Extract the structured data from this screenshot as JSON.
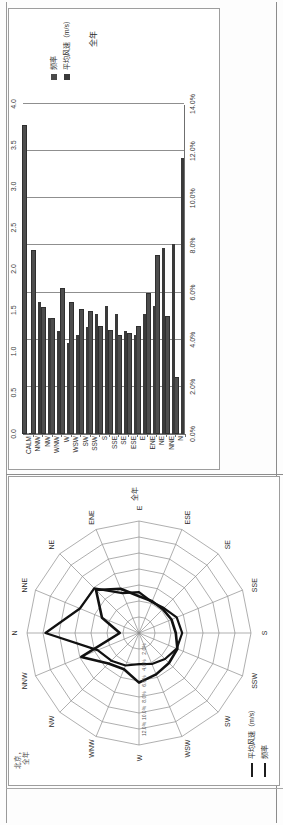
{
  "document": {
    "caption": "图 2-3-1  北京全年风玫瑰图",
    "bottom_caption_line1": "北京，",
    "bottom_caption_line2": "全年"
  },
  "bar_chart_panel": {
    "legend": [
      {
        "label": "频率",
        "color": "#4a4a4a"
      },
      {
        "label": "平均风速（m/s）",
        "color": "#3a3a3a"
      }
    ],
    "subtitle": "全年"
  },
  "rose_panel": {
    "title": "全年",
    "legend": [
      {
        "label": "平均风速（m/s）",
        "style": "thick-line"
      },
      {
        "label": "频率",
        "style": "thick-line"
      }
    ],
    "radial_ticks": [
      "2.0%",
      "4.0%",
      "6.0%",
      "8.0%",
      "10.0%",
      "12.0%"
    ],
    "directions": [
      "N",
      "NNE",
      "NE",
      "ENE",
      "E",
      "ESE",
      "SE",
      "SSE",
      "S",
      "SSW",
      "SW",
      "WSW",
      "W",
      "WNW",
      "NW",
      "NNW"
    ]
  },
  "chart_data": [
    {
      "type": "bar",
      "title": "",
      "subtitle": "全年",
      "orientation": "vertical",
      "xlabel": "",
      "ylabel": "频率",
      "y2label": "平均风速（m/s）",
      "ylim": [
        0,
        14
      ],
      "y2lim": [
        0,
        4.0
      ],
      "yticks": [
        "0.0%",
        "2.0%",
        "4.0%",
        "6.0%",
        "8.0%",
        "10.0%",
        "12.0%",
        "14.0%"
      ],
      "y2ticks": [
        "0.0",
        "0.5",
        "1.0",
        "1.5",
        "2.0",
        "2.5",
        "3.0",
        "3.5",
        "4.0"
      ],
      "grid": true,
      "legend_position": "right",
      "categories": [
        "N",
        "NNE",
        "NE",
        "ENE",
        "E",
        "ESE",
        "SE",
        "SSE",
        "S",
        "SSW",
        "SW",
        "WSW",
        "W",
        "WNW",
        "NW",
        "NNW",
        "CALM"
      ],
      "series": [
        {
          "name": "频率",
          "unit": "%",
          "axis": "left",
          "values": [
            2.4,
            5.0,
            7.6,
            6.0,
            4.6,
            4.3,
            4.2,
            4.4,
            4.6,
            5.2,
            5.3,
            5.6,
            6.2,
            4.9,
            5.4,
            7.8,
            13.1
          ]
        },
        {
          "name": "平均风速（m/s）",
          "unit": "m/s",
          "axis": "right",
          "values": [
            3.35,
            2.3,
            2.25,
            1.55,
            1.45,
            1.2,
            1.25,
            1.45,
            1.55,
            1.45,
            1.3,
            1.2,
            1.1,
            1.25,
            1.4,
            1.6,
            0.0
          ]
        }
      ]
    },
    {
      "type": "radar",
      "title": "全年",
      "radial_max": 14,
      "radial_ticks": [
        2,
        4,
        6,
        8,
        10,
        12
      ],
      "categories": [
        "N",
        "NNE",
        "NE",
        "ENE",
        "E",
        "ESE",
        "SE",
        "SSE",
        "S",
        "SSW",
        "SW",
        "WSW",
        "W",
        "WNW",
        "NW",
        "NNW"
      ],
      "series": [
        {
          "name": "频率",
          "unit": "%",
          "values": [
            2.4,
            5.0,
            7.6,
            6.0,
            4.6,
            4.3,
            4.2,
            4.4,
            4.6,
            5.2,
            5.3,
            5.6,
            6.2,
            4.9,
            5.4,
            7.8
          ]
        },
        {
          "name": "平均风速（m/s）",
          "unit": "m/s",
          "scaled_to_radial": true,
          "values": [
            11.7,
            8.0,
            7.9,
            5.4,
            5.1,
            4.2,
            4.4,
            5.1,
            5.4,
            5.1,
            4.6,
            4.2,
            3.9,
            4.4,
            4.9,
            5.6
          ]
        }
      ]
    }
  ]
}
